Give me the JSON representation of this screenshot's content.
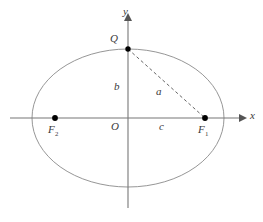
{
  "figure": {
    "axes": {
      "x_label": "x",
      "y_label": "y",
      "origin_label": "O"
    },
    "points": [
      {
        "id": "Q",
        "label": "Q",
        "sub": "",
        "x": 128,
        "y": 49,
        "role": "ellipse-top-vertex",
        "marked": true
      },
      {
        "id": "F1",
        "label": "F",
        "sub": "1",
        "x": 205,
        "y": 118,
        "role": "right-focus",
        "marked": true
      },
      {
        "id": "F2",
        "label": "F",
        "sub": "2",
        "x": 55,
        "y": 118,
        "role": "left-focus",
        "marked": true
      }
    ],
    "segments": [
      {
        "id": "a",
        "label": "a",
        "from": "Q",
        "to": "F1",
        "style": "dashed"
      },
      {
        "id": "b",
        "label": "b",
        "from": "O",
        "to": "Q",
        "style": "implicit"
      },
      {
        "id": "c",
        "label": "c",
        "from": "O",
        "to": "F1",
        "style": "implicit"
      }
    ],
    "labels": {
      "a": "a",
      "b": "b",
      "c": "c",
      "Q": "Q",
      "F1_base": "F",
      "F1_sub": "1",
      "F2_base": "F",
      "F2_sub": "2",
      "O": "O",
      "x": "x",
      "y": "y"
    },
    "colors": {
      "ellipse_stroke": "#8a8a8a",
      "axis_stroke": "#777777",
      "dashed_stroke": "#555555",
      "point_fill": "#000000",
      "text": "#3a3a3a",
      "background": "#ffffff"
    },
    "geometry": {
      "ellipse_center_x": 128,
      "ellipse_center_y": 118,
      "semi_major_px": 96,
      "semi_minor_px": 69,
      "x_axis_from": 10,
      "x_axis_to": 243,
      "y_axis_top": 17,
      "y_axis_bottom": 208
    }
  }
}
